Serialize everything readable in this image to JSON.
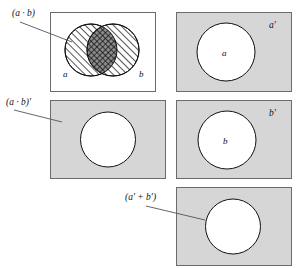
{
  "figure": {
    "background_color": "#ffffff",
    "panel_fill_gray": "#d6d6d6",
    "panel_fill_white": "#ffffff",
    "panel_border_color": "#6b6b6b",
    "ink_color": "#111111"
  },
  "panels": [
    {
      "id": "a-dot-b",
      "external_label": "(a · b)",
      "inner_labels": {
        "left": "a",
        "right": "b"
      },
      "fill": "white",
      "description": "two overlapping hatched circles, intersection cross-hatched"
    },
    {
      "id": "a-prime",
      "corner_label": "a'",
      "inner_label": "a",
      "fill": "gray",
      "description": "gray rectangle with one white circle"
    },
    {
      "id": "a-dot-b-prime",
      "external_label": "(a · b)'",
      "fill": "gray",
      "description": "gray rectangle with white lens"
    },
    {
      "id": "b-prime",
      "corner_label": "b'",
      "inner_label": "b",
      "fill": "gray",
      "description": "gray rectangle with one white circle"
    },
    {
      "id": "a-prime-plus-b-prime",
      "external_label": "(a' + b')",
      "fill": "gray",
      "description": "gray rectangle with white lens"
    }
  ],
  "labels": {
    "a_dot_b": "(a · b)",
    "a_dot_b_prime": "(a · b)'",
    "a_prime_plus_b_prime": "(a' + b')",
    "a_prime_corner": "a'",
    "b_prime_corner": "b'",
    "a_inner": "a",
    "b_inner": "b",
    "a_circle_inner": "a",
    "b_circle_inner": "b"
  }
}
